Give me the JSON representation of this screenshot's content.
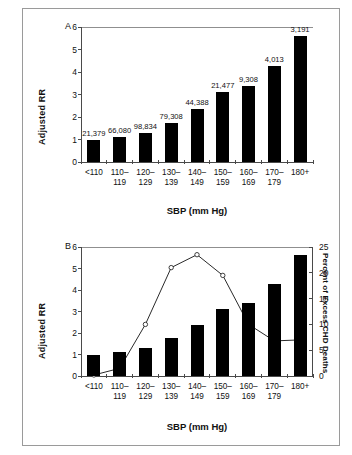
{
  "figure": {
    "panels": [
      {
        "letter": "A",
        "ylabel": "Adjusted RR",
        "xlabel": "SBP (mm Hg)"
      },
      {
        "letter": "B",
        "ylabel": "Adjusted RR",
        "ylabel_right": "Percent of Excess CHD Deaths",
        "xlabel": "SBP (mm Hg)"
      }
    ]
  },
  "chart_data": [
    {
      "type": "bar",
      "panel": "A",
      "title": "",
      "xlabel": "SBP (mm Hg)",
      "ylabel": "Adjusted RR",
      "categories": [
        "<110",
        "110–119",
        "120–129",
        "130–139",
        "140–149",
        "150–159",
        "160–169",
        "170–179",
        "180+"
      ],
      "values": [
        1.0,
        1.12,
        1.3,
        1.75,
        2.35,
        3.13,
        3.4,
        4.27,
        5.62
      ],
      "point_labels": [
        "21,379",
        "66,080",
        "98,834",
        "79,308",
        "44,388",
        "21,477",
        "9,308",
        "4,013",
        "3,191"
      ],
      "yticks": [
        0,
        1,
        2,
        3,
        4,
        5,
        6
      ],
      "ylim": [
        0,
        6
      ],
      "grid": false,
      "legend": "none"
    },
    {
      "type": "bar",
      "panel": "B",
      "title": "",
      "xlabel": "SBP (mm Hg)",
      "ylabel": "Adjusted RR",
      "ylabel_right": "Percent of Excess CHD Deaths",
      "categories": [
        "<110",
        "110–119",
        "120–129",
        "130–139",
        "140–149",
        "150–159",
        "160–169",
        "170–179",
        "180+"
      ],
      "series": [
        {
          "name": "Adjusted RR",
          "type": "bar",
          "axis": "left",
          "values": [
            1.0,
            1.12,
            1.3,
            1.75,
            2.35,
            3.13,
            3.4,
            4.27,
            5.62
          ]
        },
        {
          "name": "Percent of Excess CHD Deaths",
          "type": "line",
          "axis": "right",
          "values": [
            0.2,
            1.5,
            10.0,
            21.0,
            23.5,
            19.5,
            10.0,
            6.8,
            7.0
          ]
        }
      ],
      "yticks": [
        0,
        1,
        2,
        3,
        4,
        5,
        6
      ],
      "ylim": [
        0,
        6
      ],
      "yticks_right": [
        0,
        5,
        10,
        15,
        20,
        25
      ],
      "ylim_right": [
        0,
        25
      ],
      "grid": false,
      "legend": "none"
    }
  ],
  "xtick_lines": [
    [
      "<110",
      ""
    ],
    [
      "110–",
      "119"
    ],
    [
      "120–",
      "129"
    ],
    [
      "130–",
      "139"
    ],
    [
      "140–",
      "149"
    ],
    [
      "150–",
      "159"
    ],
    [
      "160–",
      "169"
    ],
    [
      "170–",
      "179"
    ],
    [
      "180+",
      ""
    ]
  ],
  "colors": {
    "bar": "#000000",
    "axis": "#4a4a4a",
    "frame": "#9a9a9a",
    "marker_face": "#ffffff",
    "line": "#2a2a2a"
  }
}
